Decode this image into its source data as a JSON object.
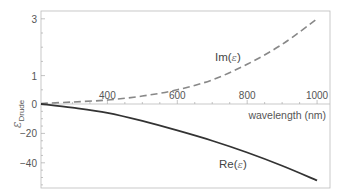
{
  "chart_data": {
    "type": "line",
    "title": "",
    "xlabel": "wavelength (nm)",
    "ylabel": "ε_Drude",
    "xlim": [
      210,
      1037
    ],
    "ylim": [
      -57,
      3.3
    ],
    "y_axis_note": "piecewise scale: 0 to 3 stretched above zero, 0 to -57 below",
    "x_ticks": [
      400,
      600,
      800,
      1000
    ],
    "y_ticks": [
      3,
      1,
      0,
      -20,
      -40
    ],
    "x_tick_labels": [
      "400",
      "600",
      "800",
      "1000"
    ],
    "y_tick_labels": [
      "3",
      "1",
      "0",
      "-20",
      "-40"
    ],
    "grid": false,
    "legend": "inline labels",
    "x": [
      210,
      300,
      400,
      500,
      600,
      700,
      800,
      900,
      1000
    ],
    "series": [
      {
        "name": "Im(ε)",
        "style": "dashed",
        "color": "#888888",
        "values": [
          0.02,
          0.07,
          0.14,
          0.28,
          0.5,
          0.85,
          1.4,
          2.1,
          3.0
        ]
      },
      {
        "name": "Re(ε)",
        "style": "solid",
        "color": "#333333",
        "values": [
          0.0,
          -2.5,
          -6,
          -11.5,
          -18,
          -25,
          -33,
          -42,
          -52
        ]
      }
    ],
    "annotations": [
      {
        "text": "Im(ε)",
        "near": "dashed curve, x≈760nm"
      },
      {
        "text": "Re(ε)",
        "near": "solid curve, x≈800nm"
      }
    ]
  },
  "labels": {
    "x_axis": "wavelength (nm)",
    "y_axis_main": "ε",
    "y_axis_sub": "Drude",
    "im_prefix": "Im(",
    "re_prefix": "Re(",
    "eps": "ε",
    "close": ")"
  }
}
